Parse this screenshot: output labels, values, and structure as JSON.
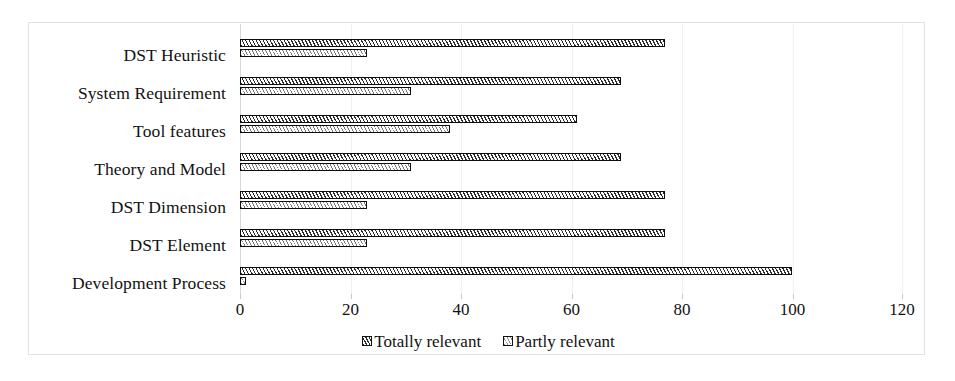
{
  "chart_data": {
    "type": "bar",
    "orientation": "horizontal",
    "title": "",
    "xlabel": "",
    "ylabel": "",
    "xlim": [
      0,
      120
    ],
    "xticks": [
      0,
      20,
      40,
      60,
      80,
      100,
      120
    ],
    "xtick_labels": [
      "0",
      "20",
      "40",
      "60",
      "80",
      "100",
      "120"
    ],
    "grid": true,
    "legend_position": "bottom",
    "categories": [
      "DST Heuristic",
      "System Requirement",
      "Tool features",
      "Theory and Model",
      "DST Dimension",
      "DST Element",
      "Development Process"
    ],
    "series": [
      {
        "name": "Totally relevant",
        "pattern": "diagonal-hatch-dark",
        "values": [
          77,
          69,
          61,
          69,
          77,
          77,
          100
        ]
      },
      {
        "name": "Partly relevant",
        "pattern": "diagonal-hatch-light",
        "values": [
          23,
          31,
          38,
          31,
          23,
          23,
          1
        ]
      }
    ]
  },
  "legend": {
    "items": [
      {
        "label": "Totally relevant",
        "swatch": "legend-swatch-totally-relevant"
      },
      {
        "label": "Partly relevant",
        "swatch": "legend-swatch-partly-relevant"
      }
    ]
  },
  "colors": {
    "frame_border": "#e2e2e2",
    "gridline": "#efefef",
    "bar_outline": "#0d0d0d",
    "hatch_dark": "#2b2b2b",
    "hatch_light": "#777777",
    "text": "#121212",
    "background": "#ffffff"
  }
}
